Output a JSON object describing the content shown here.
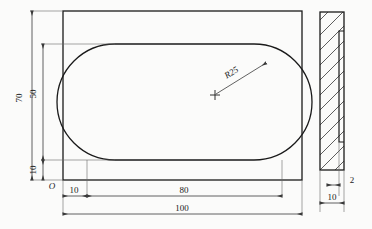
{
  "drawing": {
    "title": "Plate with obround cutout - orthographic engineering drawing",
    "background_color": "#fbfbfa",
    "line_color": "#1a1a1a",
    "dim_line_color": "#3a3a3a",
    "front_view": {
      "name": "front-view",
      "outer_plate": {
        "name": "outer-plate-rectangle",
        "width_label": "100",
        "height_label": "70"
      },
      "cutout": {
        "name": "obround-cutout",
        "width_label": "80",
        "height_label": "50",
        "corner_radius_label": "R25"
      },
      "origin_label": "O"
    },
    "side_view": {
      "name": "side-section-view",
      "thickness_label": "10",
      "step_label": "2"
    },
    "dimensions": [
      {
        "id": "dim-70",
        "label": "70",
        "orientation": "vertical",
        "view": "front"
      },
      {
        "id": "dim-50",
        "label": "50",
        "orientation": "vertical",
        "view": "front"
      },
      {
        "id": "dim-10-vertical",
        "label": "10",
        "orientation": "vertical",
        "view": "front"
      },
      {
        "id": "dim-10-horizontal",
        "label": "10",
        "orientation": "horizontal",
        "view": "front"
      },
      {
        "id": "dim-80",
        "label": "80",
        "orientation": "horizontal",
        "view": "front"
      },
      {
        "id": "dim-100",
        "label": "100",
        "orientation": "horizontal",
        "view": "front"
      },
      {
        "id": "dim-radius",
        "label": "R25",
        "orientation": "leader",
        "view": "front"
      },
      {
        "id": "dim-thickness-10",
        "label": "10",
        "orientation": "horizontal",
        "view": "side"
      },
      {
        "id": "dim-step-2",
        "label": "2",
        "orientation": "horizontal",
        "view": "side"
      }
    ]
  }
}
